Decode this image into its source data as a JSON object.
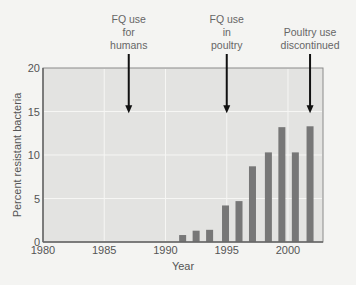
{
  "chart_data": {
    "type": "bar",
    "title": "",
    "xlabel": "Year",
    "ylabel": "Percent resistant bacteria",
    "xlim": [
      1980,
      2003
    ],
    "ylim": [
      0,
      20
    ],
    "xticks": [
      1980,
      1985,
      1990,
      1995,
      2000
    ],
    "yticks": [
      0,
      5,
      10,
      15,
      20
    ],
    "grid": true,
    "legend": null,
    "categories": [
      "1992",
      "1993",
      "1994",
      "1995",
      "1996",
      "1997",
      "1998",
      "1999",
      "2000",
      "2001"
    ],
    "x_positions": [
      1991.4,
      1992.5,
      1993.6,
      1994.9,
      1996.0,
      1997.1,
      1998.4,
      1999.5,
      2000.6,
      2001.8
    ],
    "values": [
      0.8,
      1.3,
      1.4,
      4.2,
      4.7,
      8.7,
      10.3,
      13.2,
      10.3,
      13.3
    ],
    "annotations": [
      {
        "text": "FQ use\nfor\nhumans",
        "x": 1987,
        "arrow_tip": 14.8
      },
      {
        "text": "FQ use\nin\npoultry",
        "x": 1995,
        "arrow_tip": 14.8
      },
      {
        "text": "Poultry use\ndiscontinued",
        "x": 2001.8,
        "arrow_tip": 14.8
      }
    ]
  },
  "colors": {
    "plot_bg": "#e3e3e1",
    "grid": "#f6f6f4",
    "bar": "#777777",
    "axis": "#666666",
    "arrow": "#111111"
  }
}
